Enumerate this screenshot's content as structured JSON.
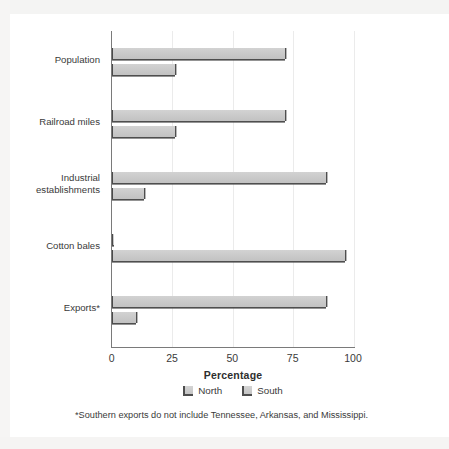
{
  "chart_data": {
    "type": "bar",
    "orientation": "horizontal",
    "title": "",
    "subtitle": "",
    "xlabel": "Percentage",
    "ylabel": "",
    "xlim": [
      0,
      100
    ],
    "xticks": [
      0,
      25,
      50,
      75,
      100
    ],
    "xtick_labels": [
      "0",
      "25",
      "50",
      "75",
      "100"
    ],
    "grid": true,
    "grid_axis": "x",
    "legend_position": "bottom-center",
    "categories": [
      "Population",
      "Railroad miles",
      "Industrial\nestablishments",
      "Cotton bales",
      "Exports*"
    ],
    "series": [
      {
        "name": "North",
        "color": "#c9c9c9",
        "values": [
          71,
          71,
          88,
          1,
          88
        ]
      },
      {
        "name": "South",
        "color": "#c9c9c9",
        "values": [
          26,
          26,
          13,
          96,
          10
        ]
      }
    ],
    "annotations": [
      "*Southern exports do not include Tennessee, Arkansas, and Mississippi."
    ]
  },
  "axis": {
    "x_title": "Percentage",
    "ticks": [
      {
        "value": 0,
        "label": "0"
      },
      {
        "value": 25,
        "label": "25"
      },
      {
        "value": 50,
        "label": "50"
      },
      {
        "value": 75,
        "label": "75"
      },
      {
        "value": 100,
        "label": "100"
      }
    ]
  },
  "categories": [
    {
      "label": "Population"
    },
    {
      "label": "Railroad miles"
    },
    {
      "label": "Industrial\nestablishments"
    },
    {
      "label": "Cotton bales"
    },
    {
      "label": "Exports*"
    }
  ],
  "legend": {
    "items": [
      {
        "label": "North",
        "swatch": "legend-swatch-north"
      },
      {
        "label": "South",
        "swatch": "legend-swatch-south"
      }
    ]
  },
  "footnote": {
    "text": "*Southern exports do not include Tennessee, Arkansas, and Mississippi."
  },
  "colors": {
    "bar_fill": "#c9c9c9",
    "bar_edge": "#4e4e4e",
    "axis": "#7a7a7a",
    "gridline": "#ebebeb",
    "text": "#3a3a3a",
    "background": "#ffffff"
  }
}
